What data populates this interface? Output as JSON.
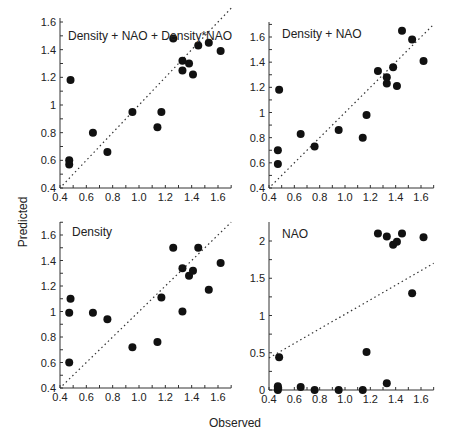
{
  "figure": {
    "xlabel": "Observed",
    "ylabel": "Predicted"
  },
  "chart_data": [
    {
      "type": "scatter",
      "title": "Density + NAO + Density*NAO",
      "xlabel": "Observed",
      "ylabel": "Predicted",
      "xlim": [
        0.4,
        1.7
      ],
      "ylim": [
        0.4,
        1.6
      ],
      "xticks": [
        "0.4",
        "0.6",
        "0.8",
        "1.0",
        "1.2",
        "1.4",
        "1.6"
      ],
      "yticks": [
        "0.4",
        "0.6",
        "0.8",
        "1",
        "1.2",
        "1.4",
        "1.6"
      ],
      "reference_line": "y = x (dotted)",
      "points": [
        [
          0.47,
          0.57
        ],
        [
          0.47,
          0.6
        ],
        [
          0.48,
          1.18
        ],
        [
          0.65,
          0.8
        ],
        [
          0.76,
          0.66
        ],
        [
          0.95,
          0.95
        ],
        [
          1.14,
          0.84
        ],
        [
          1.17,
          0.95
        ],
        [
          1.26,
          1.48
        ],
        [
          1.33,
          1.25
        ],
        [
          1.33,
          1.32
        ],
        [
          1.38,
          1.3
        ],
        [
          1.41,
          1.22
        ],
        [
          1.45,
          1.43
        ],
        [
          1.53,
          1.45
        ],
        [
          1.62,
          1.39
        ]
      ]
    },
    {
      "type": "scatter",
      "title": "Density + NAO",
      "xlabel": "Observed",
      "ylabel": "Predicted",
      "xlim": [
        0.4,
        1.7
      ],
      "ylim": [
        0.4,
        1.7
      ],
      "xticks": [
        "0.4",
        "0.6",
        "0.8",
        "1.0",
        "1.2",
        "1.4",
        "1.6"
      ],
      "yticks": [
        "0.4",
        "0.6",
        "0.8",
        "1",
        "1.2",
        "1.4",
        "1.6"
      ],
      "reference_line": "y = x (dotted)",
      "points": [
        [
          0.47,
          0.59
        ],
        [
          0.47,
          0.7
        ],
        [
          0.48,
          1.18
        ],
        [
          0.65,
          0.83
        ],
        [
          0.76,
          0.73
        ],
        [
          0.95,
          0.86
        ],
        [
          1.14,
          0.8
        ],
        [
          1.17,
          0.98
        ],
        [
          1.26,
          1.33
        ],
        [
          1.33,
          1.23
        ],
        [
          1.33,
          1.28
        ],
        [
          1.38,
          1.36
        ],
        [
          1.41,
          1.21
        ],
        [
          1.45,
          1.65
        ],
        [
          1.53,
          1.58
        ],
        [
          1.62,
          1.41
        ]
      ]
    },
    {
      "type": "scatter",
      "title": "Density",
      "xlabel": "Observed",
      "ylabel": "Predicted",
      "xlim": [
        0.4,
        1.7
      ],
      "ylim": [
        0.4,
        1.7
      ],
      "xticks": [
        "0.4",
        "0.6",
        "0.8",
        "1.0",
        "1.2",
        "1.4",
        "1.6"
      ],
      "yticks": [
        "0.4",
        "0.6",
        "0.8",
        "1",
        "1.2",
        "1.4",
        "1.6"
      ],
      "reference_line": "y = x (dotted)",
      "points": [
        [
          0.47,
          0.6
        ],
        [
          0.47,
          0.99
        ],
        [
          0.48,
          1.1
        ],
        [
          0.65,
          0.99
        ],
        [
          0.76,
          0.94
        ],
        [
          0.95,
          0.72
        ],
        [
          1.14,
          0.76
        ],
        [
          1.17,
          1.11
        ],
        [
          1.26,
          1.5
        ],
        [
          1.33,
          1.0
        ],
        [
          1.33,
          1.34
        ],
        [
          1.38,
          1.28
        ],
        [
          1.41,
          1.32
        ],
        [
          1.45,
          1.5
        ],
        [
          1.53,
          1.17
        ],
        [
          1.62,
          1.38
        ]
      ]
    },
    {
      "type": "scatter",
      "title": "NAO",
      "xlabel": "Observed",
      "ylabel": "Predicted",
      "xlim": [
        0.4,
        1.7
      ],
      "ylim": [
        0,
        2.2
      ],
      "xticks": [
        "0.4",
        "0.6",
        "0.8",
        "1.0",
        "1.2",
        "1.4",
        "1.6"
      ],
      "yticks": [
        "0",
        "0.5",
        "1",
        "1.5",
        "2"
      ],
      "reference_line": "regression line (dotted), from (0.4,0.43) to (1.7,1.7)",
      "points": [
        [
          0.47,
          0.0
        ],
        [
          0.47,
          0.03
        ],
        [
          0.47,
          0.05
        ],
        [
          0.48,
          0.44
        ],
        [
          0.65,
          0.04
        ],
        [
          0.76,
          0.0
        ],
        [
          0.95,
          0.0
        ],
        [
          1.14,
          0.0
        ],
        [
          1.17,
          0.51
        ],
        [
          1.26,
          2.1
        ],
        [
          1.33,
          2.06
        ],
        [
          1.33,
          0.09
        ],
        [
          1.38,
          1.95
        ],
        [
          1.41,
          1.99
        ],
        [
          1.45,
          2.1
        ],
        [
          1.53,
          1.3
        ],
        [
          1.62,
          2.05
        ]
      ]
    }
  ]
}
